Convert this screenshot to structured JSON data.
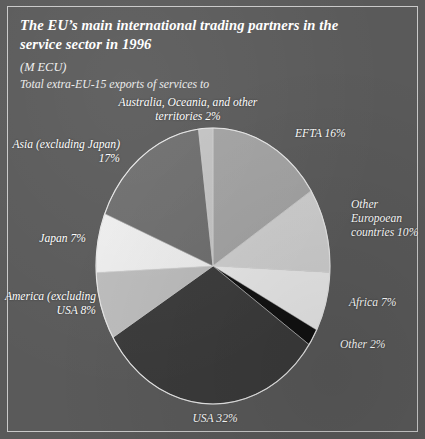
{
  "card": {
    "title": "The EU’s main international trading partners in the service sector in 1996",
    "unit": "(M ECU)",
    "subtitle": "Total extra-EU-15 exports of services to",
    "background_color": "#5a5a5a",
    "border_color": "#c9c9c9",
    "text_color": "#ffffff"
  },
  "chart_data": {
    "type": "pie",
    "title": "The EU’s main international trading partners in the service sector in 1996",
    "subtitle": "Total extra-EU-15 exports of services to",
    "unit": "(M ECU)",
    "value_unit": "percent",
    "start_angle_deg": 0,
    "direction": "clockwise",
    "legend": "none",
    "labels_position": "outside",
    "categories": [
      "EFTA",
      "Other Europoean countries",
      "Africa",
      "Other",
      "USA",
      "America (excluding USA",
      "Japan",
      "Asia (excluding Japan)",
      "Australia, Oceania, and other territories"
    ],
    "values": [
      16,
      10,
      7,
      2,
      32,
      8,
      7,
      17,
      2
    ],
    "colors": [
      "#a3a3a3",
      "#cfcfcf",
      "#e9e9e9",
      "#111111",
      "#3b3b3b",
      "#bdbdbd",
      "#eeeeee",
      "#6e6e6e",
      "#c4c4c4"
    ],
    "slices": [
      {
        "label": "EFTA 16%",
        "name": "EFTA",
        "value": 16,
        "color": "#a3a3a3"
      },
      {
        "label": "Other Europoean countries 10%",
        "name": "Other Europoean countries",
        "value": 10,
        "color": "#cfcfcf"
      },
      {
        "label": "Africa 7%",
        "name": "Africa",
        "value": 7,
        "color": "#e9e9e9"
      },
      {
        "label": "Other 2%",
        "name": "Other",
        "value": 2,
        "color": "#111111"
      },
      {
        "label": "USA 32%",
        "name": "USA",
        "value": 32,
        "color": "#3b3b3b"
      },
      {
        "label": "America (excluding USA 8%",
        "name": "America (excluding USA",
        "value": 8,
        "color": "#bdbdbd"
      },
      {
        "label": "Japan 7%",
        "name": "Japan",
        "value": 7,
        "color": "#eeeeee"
      },
      {
        "label": "Asia (excluding Japan) 17%",
        "name": "Asia (excluding Japan)",
        "value": 17,
        "color": "#6e6e6e"
      },
      {
        "label": "Australia, Oceania, and other territories 2%",
        "name": "Australia, Oceania, and other territories",
        "value": 2,
        "color": "#c4c4c4"
      }
    ]
  },
  "labels": {
    "australia": "Australia, Oceania, and other territories 2%",
    "efta": "EFTA 16%",
    "other_european": "Other Europoean countries 10%",
    "africa": "Africa 7%",
    "other": "Other 2%",
    "usa": "USA 32%",
    "america": "America (excluding USA 8%",
    "japan": "Japan 7%",
    "asia": "Asia (excluding Japan) 17%"
  }
}
